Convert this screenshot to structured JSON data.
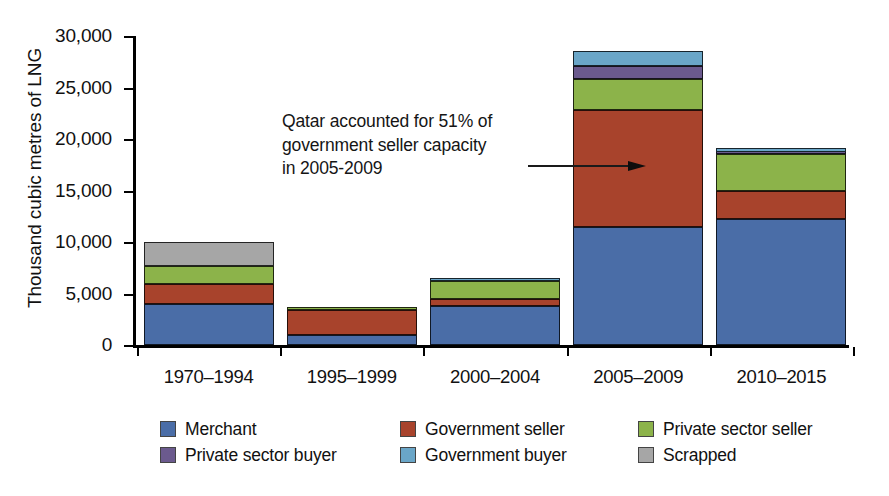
{
  "chart_data": {
    "type": "bar",
    "subtype": "stacked-bar",
    "title": "",
    "xlabel": "",
    "ylabel": "Thousand cubic metres of LNG",
    "ylim": [
      0,
      30000
    ],
    "yticks": [
      0,
      5000,
      10000,
      15000,
      20000,
      25000,
      30000
    ],
    "ytick_labels": [
      "0",
      "5,000",
      "10,000",
      "15,000",
      "20,000",
      "25,000",
      "30,000"
    ],
    "grid": false,
    "legend_position": "bottom",
    "categories": [
      "1970–1994",
      "1995–1999",
      "2000–2004",
      "2005–2009",
      "2010–2015"
    ],
    "series": [
      {
        "name": "Merchant",
        "color": "#4a6da7",
        "values": [
          3950,
          1000,
          3800,
          11450,
          12200
        ]
      },
      {
        "name": "Government seller",
        "color": "#a8432c",
        "values": [
          1950,
          2400,
          700,
          11400,
          2800
        ]
      },
      {
        "name": "Private sector seller",
        "color": "#8cb34a",
        "values": [
          1750,
          200,
          1700,
          3000,
          3500
        ]
      },
      {
        "name": "Private sector buyer",
        "color": "#6b5a8e",
        "values": [
          0,
          0,
          50,
          1200,
          200
        ]
      },
      {
        "name": "Government buyer",
        "color": "#6aa6c8",
        "values": [
          0,
          0,
          300,
          1450,
          400
        ]
      },
      {
        "name": "Scrapped",
        "color": "#a6a6a6",
        "values": [
          2400,
          0,
          0,
          0,
          0
        ]
      }
    ],
    "totals": [
      10050,
      3600,
      6550,
      28500,
      19100
    ],
    "annotations": [
      {
        "text": "Qatar accounted for 51% of\ngovernment seller capacity\nin 2005-2009",
        "points_to": "2005–2009 government seller segment"
      }
    ]
  },
  "legend": {
    "items": [
      {
        "label": "Merchant",
        "color": "#4a6da7"
      },
      {
        "label": "Government seller",
        "color": "#a8432c"
      },
      {
        "label": "Private sector seller",
        "color": "#8cb34a"
      },
      {
        "label": "Private sector buyer",
        "color": "#6b5a8e"
      },
      {
        "label": "Government buyer",
        "color": "#6aa6c8"
      },
      {
        "label": "Scrapped",
        "color": "#a6a6a6"
      }
    ]
  }
}
